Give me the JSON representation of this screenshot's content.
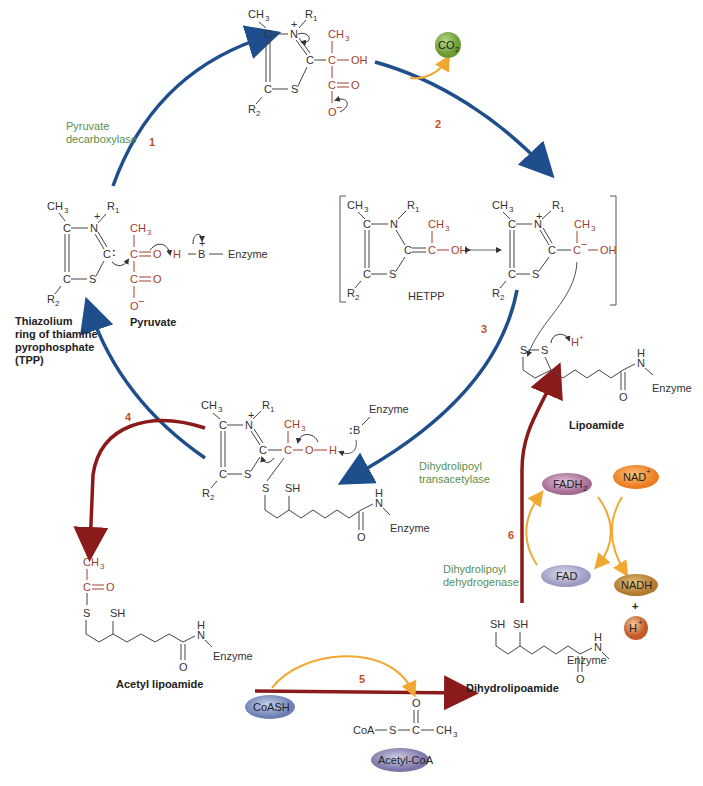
{
  "diagram": {
    "steps": [
      {
        "number": "1",
        "enzyme": [
          "Pyruvate",
          "decarboxylase"
        ]
      },
      {
        "number": "2"
      },
      {
        "number": "3",
        "enzyme": [
          "Dihydrolipoyl",
          "transacetylase"
        ]
      },
      {
        "number": "4"
      },
      {
        "number": "5"
      },
      {
        "number": "6",
        "enzyme": [
          "Dihydrolipoyl",
          "dehydrogenase"
        ]
      }
    ],
    "captions": {
      "tpp": [
        "Thiazolium",
        "ring of thiamine",
        "pyrophosphate",
        "(TPP)"
      ],
      "pyruvate": "Pyruvate",
      "hetpp": "HETPP",
      "lipoamide": "Lipoamide",
      "acetyl_lipoamide": "Acetyl lipoamide",
      "dihydrolipoamide": "Dihydrolipoamide"
    },
    "molecules": {
      "co2": "CO",
      "co2_sub": "2",
      "fadh2": "FADH",
      "fadh2_sub": "2",
      "fad": "FAD",
      "nad": "NAD",
      "nad_sup": "+",
      "nadh": "NADH",
      "plus": "+",
      "h": "H",
      "h_sup": "+",
      "coash": "CoASH",
      "acetyl_coa": "Acetyl-CoA",
      "acetyl_coa_formula": [
        "CoA",
        "S",
        "C",
        "CH",
        "3",
        "O"
      ]
    },
    "atoms": {
      "ch3": "CH",
      "three": "3",
      "r1": "R",
      "one": "1",
      "r2": "R",
      "two": "2",
      "c": "C",
      "n": "N",
      "s": "S",
      "o": "O",
      "oh": "OH",
      "h": "H",
      "b": "B",
      "enzyme": "Enzyme",
      "sh": "SH",
      "plus": "+",
      "minus": "−",
      "h_plus": "H"
    },
    "colors": {
      "blue_arrow": "#1f4e8c",
      "red_arrow": "#8b1a1a",
      "orange_arrow": "#f0a830",
      "enzyme_label": "#5a8f4e",
      "step_number": "#c0502a",
      "substrate_atoms": "#a0412d",
      "co2": "#7cab3c",
      "fadh2": "#b07a9e",
      "fad": "#a7a6c8",
      "nad": "#f08a2a",
      "nadh": "#c0893a",
      "h_ion": "#d9743a",
      "coash": "#7b8fbf",
      "acetyl_coa": "#8a86b4"
    }
  }
}
